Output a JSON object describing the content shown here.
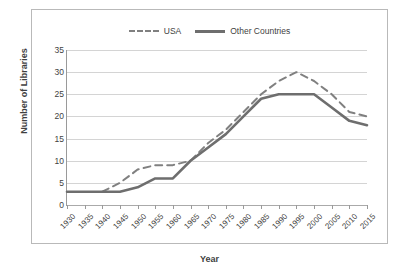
{
  "chart_data": {
    "type": "line",
    "title": "",
    "xlabel": "Year",
    "ylabel": "Number of Libraries",
    "categories": [
      "1930",
      "1935",
      "1940",
      "1945",
      "1950",
      "1955",
      "1960",
      "1965",
      "1970",
      "1975",
      "1980",
      "1985",
      "1990",
      "1995",
      "2000",
      "2005",
      "2010",
      "2015"
    ],
    "ylim": [
      0,
      35
    ],
    "ytick_labels": [
      "0",
      "5",
      "10",
      "15",
      "20",
      "25",
      "30",
      "35"
    ],
    "ytick_values": [
      0,
      5,
      10,
      15,
      20,
      25,
      30,
      35
    ],
    "grid": true,
    "legend_position": "top-center",
    "series": [
      {
        "name": "USA",
        "style": "dashed",
        "color": "#808080",
        "values": [
          null,
          null,
          3,
          5,
          8,
          9,
          9,
          10,
          14,
          17,
          21,
          25,
          28,
          30,
          28,
          25,
          21,
          20
        ]
      },
      {
        "name": "Other Countries",
        "style": "solid",
        "color": "#6e6e6e",
        "values": [
          3,
          3,
          3,
          3,
          4,
          6,
          6,
          10,
          13,
          16,
          20,
          24,
          25,
          25,
          25,
          22,
          19,
          18
        ]
      }
    ]
  },
  "legend": {
    "entries": [
      {
        "label": "USA"
      },
      {
        "label": "Other Countries"
      }
    ]
  },
  "axes": {
    "y_title": "Number of Libraries",
    "x_title": "Year"
  }
}
